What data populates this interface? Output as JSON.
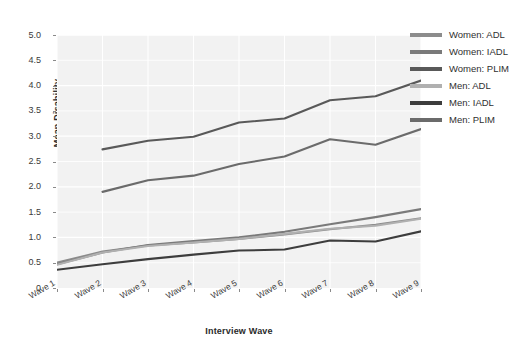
{
  "chart_data": {
    "type": "line",
    "title": "",
    "xlabel": "Interview Wave",
    "ylabel": "Mean Disability",
    "categories": [
      "Wave 1",
      "Wave 2",
      "Wave 3",
      "Wave 4",
      "Wave 5",
      "Wave 6",
      "Wave 7",
      "Wave 8",
      "Wave 9"
    ],
    "ylim": [
      0,
      5.0
    ],
    "yticks": [
      "0",
      "0.5",
      "1.0",
      "1.5",
      "2.0",
      "2.5",
      "3.0",
      "3.5",
      "4.0",
      "4.5",
      "5.0"
    ],
    "ytick_values": [
      0,
      0.5,
      1.0,
      1.5,
      2.0,
      2.5,
      3.0,
      3.5,
      4.0,
      4.5,
      5.0
    ],
    "grid": true,
    "legend_position": "right",
    "series": [
      {
        "name": "Women: ADL",
        "color": "#8c8c8c",
        "values": [
          0.5,
          0.72,
          0.84,
          0.9,
          0.97,
          1.06,
          1.16,
          1.25,
          1.38
        ]
      },
      {
        "name": "Women: IADL",
        "color": "#7a7a7a",
        "values": [
          0.47,
          0.7,
          0.85,
          0.93,
          1.0,
          1.11,
          1.26,
          1.4,
          1.56
        ]
      },
      {
        "name": "Women: PLIM",
        "color": "#595959",
        "values": [
          null,
          2.74,
          2.91,
          2.99,
          3.27,
          3.35,
          3.71,
          3.79,
          4.1
        ]
      },
      {
        "name": "Men: ADL",
        "color": "#b0b0b0",
        "values": [
          0.46,
          0.7,
          0.83,
          0.9,
          0.97,
          1.07,
          1.17,
          1.23,
          1.37
        ]
      },
      {
        "name": "Men: IADL",
        "color": "#3d3d3d",
        "values": [
          0.36,
          0.47,
          0.57,
          0.66,
          0.74,
          0.76,
          0.94,
          0.92,
          1.12
        ]
      },
      {
        "name": "Men: PLIM",
        "color": "#6b6b6b",
        "values": [
          null,
          1.9,
          2.13,
          2.22,
          2.45,
          2.6,
          2.94,
          2.83,
          3.14
        ]
      }
    ]
  },
  "legend": {
    "items": [
      {
        "label": "Women: ADL",
        "color": "#8c8c8c"
      },
      {
        "label": "Women: IADL",
        "color": "#7a7a7a"
      },
      {
        "label": "Women: PLIM",
        "color": "#595959"
      },
      {
        "label": "Men: ADL",
        "color": "#b0b0b0"
      },
      {
        "label": "Men: IADL",
        "color": "#3d3d3d"
      },
      {
        "label": "Men: PLIM",
        "color": "#6b6b6b"
      }
    ]
  },
  "style": {
    "panel_bg": "#f2f2f2",
    "grid_color": "#ffffff",
    "page_bg": "#ffffff",
    "text_color": "#3a3a3a"
  }
}
